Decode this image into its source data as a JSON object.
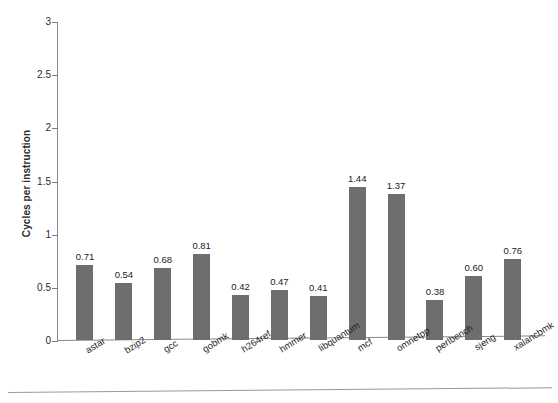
{
  "chart_data": {
    "type": "bar",
    "title": "",
    "subtitle": "",
    "xlabel": "",
    "ylabel": "Cycles per instruction",
    "ylim": [
      0,
      3
    ],
    "yticks": [
      "0",
      "0.5",
      "1",
      "1.5",
      "2",
      "2.5",
      "3"
    ],
    "ytick_values": [
      0,
      0.5,
      1,
      1.5,
      2,
      2.5,
      3
    ],
    "grid": false,
    "legend": null,
    "bar_color": "#6e6e6e",
    "axis_color": "#8a8a8a",
    "categories": [
      "astar",
      "bzip2",
      "gcc",
      "gobmk",
      "h264ref",
      "hmmer",
      "libquantum",
      "mcf",
      "omnetpp",
      "perlbench",
      "sjeng",
      "xalancbmk"
    ],
    "values": [
      0.71,
      0.54,
      0.68,
      0.81,
      0.42,
      0.47,
      0.41,
      1.44,
      1.37,
      0.38,
      0.6,
      0.76
    ],
    "value_labels": [
      "0.71",
      "0.54",
      "0.68",
      "0.81",
      "0.42",
      "0.47",
      "0.41",
      "1.44",
      "1.37",
      "0.38",
      "0.60",
      "0.76"
    ]
  }
}
